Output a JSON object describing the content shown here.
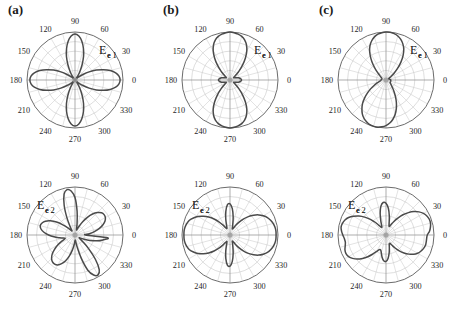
{
  "figure": {
    "panels": [
      {
        "id": "panel-a-top",
        "panel_label": "(a)",
        "field_label": "E",
        "field_sub_bold": "e",
        "field_sub_num": "1",
        "label_pos": "right",
        "x": 0,
        "y": 0
      },
      {
        "id": "panel-b-top",
        "panel_label": "(b)",
        "field_label": "E",
        "field_sub_bold": "e",
        "field_sub_num": "1",
        "label_pos": "right",
        "x": 155,
        "y": 0
      },
      {
        "id": "panel-c-top",
        "panel_label": "(c)",
        "field_label": "E",
        "field_sub_bold": "e",
        "field_sub_num": "1",
        "label_pos": "right",
        "x": 311,
        "y": 0
      },
      {
        "id": "panel-a-bottom",
        "panel_label": "",
        "field_label": "E",
        "field_sub_bold": "e",
        "field_sub_num": "2",
        "label_pos": "left",
        "x": 0,
        "y": 155
      },
      {
        "id": "panel-b-bottom",
        "panel_label": "",
        "field_label": "E",
        "field_sub_bold": "e",
        "field_sub_num": "2",
        "label_pos": "left",
        "x": 155,
        "y": 155
      },
      {
        "id": "panel-c-bottom",
        "panel_label": "",
        "field_label": "E",
        "field_sub_bold": "e",
        "field_sub_num": "2",
        "label_pos": "left",
        "x": 311,
        "y": 155
      }
    ]
  },
  "chart_data": [
    {
      "id": "panel-a-top",
      "type": "line",
      "subtype": "polar",
      "title": "(a) Ee1",
      "xlabel": "angle (degrees)",
      "ylabel": "normalized field magnitude",
      "theta_ticks": [
        0,
        30,
        60,
        90,
        120,
        150,
        180,
        210,
        240,
        270,
        300,
        330
      ],
      "theta_tick_labels": [
        "0",
        "30",
        "60",
        "90",
        "120",
        "150",
        "180",
        "210",
        "240",
        "270",
        "300",
        "330"
      ],
      "grid": true,
      "grid_rings": 5,
      "rlim": [
        0,
        1
      ],
      "legend": "none",
      "description": "four-lobe clover pattern, maxima at 0, 90, 180, 270 degrees",
      "theta": [
        0,
        5,
        10,
        15,
        20,
        25,
        30,
        35,
        40,
        45,
        50,
        55,
        60,
        65,
        70,
        75,
        80,
        85,
        90,
        95,
        100,
        105,
        110,
        115,
        120,
        125,
        130,
        135,
        140,
        145,
        150,
        155,
        160,
        165,
        170,
        175,
        180,
        185,
        190,
        195,
        200,
        205,
        210,
        215,
        220,
        225,
        230,
        235,
        240,
        245,
        250,
        255,
        260,
        265,
        270,
        275,
        280,
        285,
        290,
        295,
        300,
        305,
        310,
        315,
        320,
        325,
        330,
        335,
        340,
        345,
        350,
        355
      ],
      "r": [
        0.94,
        0.92,
        0.86,
        0.76,
        0.63,
        0.49,
        0.34,
        0.2,
        0.09,
        0.03,
        0.03,
        0.09,
        0.2,
        0.35,
        0.52,
        0.68,
        0.82,
        0.92,
        0.96,
        0.92,
        0.82,
        0.68,
        0.52,
        0.35,
        0.2,
        0.09,
        0.03,
        0.03,
        0.09,
        0.2,
        0.34,
        0.49,
        0.63,
        0.76,
        0.86,
        0.92,
        0.94,
        0.92,
        0.86,
        0.76,
        0.63,
        0.49,
        0.34,
        0.2,
        0.09,
        0.03,
        0.03,
        0.09,
        0.2,
        0.35,
        0.52,
        0.68,
        0.82,
        0.92,
        0.96,
        0.92,
        0.82,
        0.68,
        0.52,
        0.35,
        0.2,
        0.09,
        0.03,
        0.03,
        0.09,
        0.2,
        0.34,
        0.49,
        0.63,
        0.76,
        0.86,
        0.92
      ]
    },
    {
      "id": "panel-b-top",
      "type": "line",
      "subtype": "polar",
      "title": "(b) Ee1",
      "xlabel": "angle (degrees)",
      "ylabel": "normalized field magnitude",
      "theta_ticks": [
        0,
        30,
        60,
        90,
        120,
        150,
        180,
        210,
        240,
        270,
        300,
        330
      ],
      "theta_tick_labels": [
        "0",
        "30",
        "60",
        "90",
        "120",
        "150",
        "180",
        "210",
        "240",
        "270",
        "300",
        "330"
      ],
      "grid": true,
      "grid_rings": 5,
      "rlim": [
        0,
        1
      ],
      "legend": "none",
      "description": "two large vertical lobes at 90 and 270 degrees with small side lobes near 0 and 180 degrees",
      "theta": [
        0,
        5,
        10,
        15,
        20,
        25,
        30,
        35,
        40,
        45,
        50,
        55,
        60,
        65,
        70,
        75,
        80,
        85,
        90,
        95,
        100,
        105,
        110,
        115,
        120,
        125,
        130,
        135,
        140,
        145,
        150,
        155,
        160,
        165,
        170,
        175,
        180,
        185,
        190,
        195,
        200,
        205,
        210,
        215,
        220,
        225,
        230,
        235,
        240,
        245,
        250,
        255,
        260,
        265,
        270,
        275,
        280,
        285,
        290,
        295,
        300,
        305,
        310,
        315,
        320,
        325,
        330,
        335,
        340,
        345,
        350,
        355
      ],
      "r": [
        0.24,
        0.23,
        0.21,
        0.18,
        0.14,
        0.11,
        0.09,
        0.1,
        0.16,
        0.27,
        0.41,
        0.56,
        0.7,
        0.81,
        0.89,
        0.94,
        0.97,
        0.99,
        1.0,
        0.99,
        0.97,
        0.94,
        0.89,
        0.81,
        0.7,
        0.56,
        0.41,
        0.27,
        0.16,
        0.1,
        0.09,
        0.11,
        0.14,
        0.18,
        0.21,
        0.23,
        0.24,
        0.23,
        0.21,
        0.18,
        0.14,
        0.11,
        0.09,
        0.1,
        0.16,
        0.27,
        0.41,
        0.56,
        0.7,
        0.81,
        0.89,
        0.94,
        0.97,
        0.99,
        1.0,
        0.99,
        0.97,
        0.94,
        0.89,
        0.81,
        0.7,
        0.56,
        0.41,
        0.27,
        0.16,
        0.1,
        0.09,
        0.11,
        0.14,
        0.18,
        0.21,
        0.23
      ]
    },
    {
      "id": "panel-c-top",
      "type": "line",
      "subtype": "polar",
      "title": "(c) Ee1",
      "xlabel": "angle (degrees)",
      "ylabel": "normalized field magnitude",
      "theta_ticks": [
        0,
        30,
        60,
        90,
        120,
        150,
        180,
        210,
        240,
        270,
        300,
        330
      ],
      "theta_tick_labels": [
        "0",
        "30",
        "60",
        "90",
        "120",
        "150",
        "180",
        "210",
        "240",
        "270",
        "300",
        "330"
      ],
      "grid": true,
      "grid_rings": 5,
      "rlim": [
        0,
        1
      ],
      "legend": "none",
      "description": "two large tilted lobes, upper lobe peaking near 100 degrees and lower lobe near 285 degrees, slight asymmetry",
      "theta": [
        0,
        5,
        10,
        15,
        20,
        25,
        30,
        35,
        40,
        45,
        50,
        55,
        60,
        65,
        70,
        75,
        80,
        85,
        90,
        95,
        100,
        105,
        110,
        115,
        120,
        125,
        130,
        135,
        140,
        145,
        150,
        155,
        160,
        165,
        170,
        175,
        180,
        185,
        190,
        195,
        200,
        205,
        210,
        215,
        220,
        225,
        230,
        235,
        240,
        245,
        250,
        255,
        260,
        265,
        270,
        275,
        280,
        285,
        290,
        295,
        300,
        305,
        310,
        315,
        320,
        325,
        330,
        335,
        340,
        345,
        350,
        355
      ],
      "r": [
        0.1,
        0.09,
        0.08,
        0.07,
        0.06,
        0.06,
        0.08,
        0.13,
        0.22,
        0.34,
        0.48,
        0.62,
        0.74,
        0.83,
        0.9,
        0.95,
        0.98,
        1.0,
        1.0,
        0.99,
        0.97,
        0.93,
        0.87,
        0.79,
        0.68,
        0.55,
        0.42,
        0.3,
        0.21,
        0.15,
        0.12,
        0.1,
        0.09,
        0.09,
        0.09,
        0.1,
        0.1,
        0.11,
        0.13,
        0.16,
        0.21,
        0.28,
        0.37,
        0.47,
        0.58,
        0.69,
        0.78,
        0.86,
        0.92,
        0.96,
        0.99,
        1.0,
        1.0,
        0.98,
        0.95,
        0.9,
        0.83,
        0.74,
        0.63,
        0.51,
        0.39,
        0.29,
        0.21,
        0.16,
        0.13,
        0.11,
        0.1,
        0.1,
        0.1,
        0.1,
        0.1,
        0.1
      ]
    },
    {
      "id": "panel-a-bottom",
      "type": "line",
      "subtype": "polar",
      "title": "(a) Ee2",
      "xlabel": "angle (degrees)",
      "ylabel": "normalized field magnitude",
      "theta_ticks": [
        0,
        30,
        60,
        90,
        120,
        150,
        180,
        210,
        240,
        270,
        300,
        330
      ],
      "theta_tick_labels": [
        "0",
        "30",
        "60",
        "90",
        "120",
        "150",
        "180",
        "210",
        "240",
        "270",
        "300",
        "330"
      ],
      "grid": true,
      "grid_rings": 5,
      "rlim": [
        0,
        1
      ],
      "legend": "none",
      "description": "six-lobe pattern: narrow vertical lobes at 90 and 270 degrees plus four diagonal lobes near 35, 145, 215 and 325 degrees",
      "theta": [
        0,
        5,
        10,
        15,
        20,
        25,
        30,
        35,
        40,
        45,
        50,
        55,
        60,
        65,
        70,
        75,
        80,
        85,
        90,
        95,
        100,
        105,
        110,
        115,
        120,
        125,
        130,
        135,
        140,
        145,
        150,
        155,
        160,
        165,
        170,
        175,
        180,
        185,
        190,
        195,
        200,
        205,
        210,
        215,
        220,
        225,
        230,
        235,
        240,
        245,
        250,
        255,
        260,
        265,
        270,
        275,
        280,
        285,
        290,
        295,
        300,
        305,
        310,
        315,
        320,
        325,
        330,
        335,
        340,
        345,
        350,
        355
      ],
      "r": [
        0.22,
        0.3,
        0.41,
        0.52,
        0.62,
        0.69,
        0.73,
        0.74,
        0.72,
        0.66,
        0.57,
        0.45,
        0.32,
        0.2,
        0.12,
        0.12,
        0.25,
        0.5,
        0.78,
        0.92,
        0.96,
        0.88,
        0.66,
        0.4,
        0.2,
        0.11,
        0.12,
        0.21,
        0.33,
        0.47,
        0.59,
        0.68,
        0.73,
        0.75,
        0.72,
        0.65,
        0.55,
        0.44,
        0.33,
        0.25,
        0.22,
        0.3,
        0.41,
        0.52,
        0.62,
        0.69,
        0.73,
        0.74,
        0.72,
        0.66,
        0.57,
        0.45,
        0.32,
        0.2,
        0.12,
        0.12,
        0.25,
        0.5,
        0.78,
        0.92,
        0.96,
        0.88,
        0.66,
        0.4,
        0.2,
        0.11,
        0.12,
        0.21,
        0.33,
        0.47,
        0.59,
        0.68
      ]
    },
    {
      "id": "panel-b-bottom",
      "type": "line",
      "subtype": "polar",
      "title": "(b) Ee2",
      "xlabel": "angle (degrees)",
      "ylabel": "normalized field magnitude",
      "theta_ticks": [
        0,
        30,
        60,
        90,
        120,
        150,
        180,
        210,
        240,
        270,
        300,
        330
      ],
      "theta_tick_labels": [
        "0",
        "30",
        "60",
        "90",
        "120",
        "150",
        "180",
        "210",
        "240",
        "270",
        "300",
        "330"
      ],
      "grid": true,
      "grid_rings": 5,
      "rlim": [
        0,
        1
      ],
      "legend": "none",
      "description": "large horizontal lobes at 0 and 180 degrees plus narrower vertical lobes at 90 and 270 degrees",
      "theta": [
        0,
        5,
        10,
        15,
        20,
        25,
        30,
        35,
        40,
        45,
        50,
        55,
        60,
        65,
        70,
        75,
        80,
        85,
        90,
        95,
        100,
        105,
        110,
        115,
        120,
        125,
        130,
        135,
        140,
        145,
        150,
        155,
        160,
        165,
        170,
        175,
        180,
        185,
        190,
        195,
        200,
        205,
        210,
        215,
        220,
        225,
        230,
        235,
        240,
        245,
        250,
        255,
        260,
        265,
        270,
        275,
        280,
        285,
        290,
        295,
        300,
        305,
        310,
        315,
        320,
        325,
        330,
        335,
        340,
        345,
        350,
        355
      ],
      "r": [
        0.96,
        0.96,
        0.95,
        0.93,
        0.9,
        0.86,
        0.8,
        0.73,
        0.64,
        0.54,
        0.43,
        0.32,
        0.22,
        0.15,
        0.14,
        0.22,
        0.38,
        0.55,
        0.65,
        0.63,
        0.5,
        0.34,
        0.21,
        0.15,
        0.17,
        0.25,
        0.36,
        0.47,
        0.58,
        0.68,
        0.77,
        0.84,
        0.9,
        0.93,
        0.95,
        0.96,
        0.96,
        0.96,
        0.95,
        0.93,
        0.9,
        0.84,
        0.77,
        0.68,
        0.58,
        0.47,
        0.36,
        0.25,
        0.17,
        0.15,
        0.21,
        0.34,
        0.5,
        0.63,
        0.65,
        0.55,
        0.38,
        0.22,
        0.14,
        0.15,
        0.22,
        0.32,
        0.43,
        0.54,
        0.64,
        0.73,
        0.8,
        0.86,
        0.9,
        0.93,
        0.95,
        0.96
      ]
    },
    {
      "id": "panel-c-bottom",
      "type": "line",
      "subtype": "polar",
      "title": "(c) Ee2",
      "xlabel": "angle (degrees)",
      "ylabel": "normalized field magnitude",
      "theta_ticks": [
        0,
        30,
        60,
        90,
        120,
        150,
        180,
        210,
        240,
        270,
        300,
        330
      ],
      "theta_tick_labels": [
        "0",
        "30",
        "60",
        "90",
        "120",
        "150",
        "180",
        "210",
        "240",
        "270",
        "300",
        "330"
      ],
      "grid": true,
      "grid_rings": 5,
      "rlim": [
        0,
        1
      ],
      "legend": "none",
      "description": "asymmetric four-lobe pattern, broad lobes tilted toward 20 and 200 degrees with narrower vertical lobes near 95 and 265 degrees",
      "theta": [
        0,
        5,
        10,
        15,
        20,
        25,
        30,
        35,
        40,
        45,
        50,
        55,
        60,
        65,
        70,
        75,
        80,
        85,
        90,
        95,
        100,
        105,
        110,
        115,
        120,
        125,
        130,
        135,
        140,
        145,
        150,
        155,
        160,
        165,
        170,
        175,
        180,
        185,
        190,
        195,
        200,
        205,
        210,
        215,
        220,
        225,
        230,
        235,
        240,
        245,
        250,
        255,
        260,
        265,
        270,
        275,
        280,
        285,
        290,
        295,
        300,
        305,
        310,
        315,
        320,
        325,
        330,
        335,
        340,
        345,
        350,
        355
      ],
      "r": [
        0.86,
        0.91,
        0.94,
        0.96,
        0.96,
        0.94,
        0.9,
        0.84,
        0.76,
        0.66,
        0.55,
        0.43,
        0.32,
        0.23,
        0.19,
        0.25,
        0.4,
        0.56,
        0.66,
        0.68,
        0.61,
        0.47,
        0.32,
        0.21,
        0.18,
        0.23,
        0.34,
        0.46,
        0.58,
        0.69,
        0.78,
        0.86,
        0.91,
        0.94,
        0.95,
        0.93,
        0.9,
        0.87,
        0.86,
        0.88,
        0.91,
        0.92,
        0.9,
        0.85,
        0.78,
        0.69,
        0.59,
        0.49,
        0.4,
        0.34,
        0.33,
        0.38,
        0.47,
        0.54,
        0.55,
        0.49,
        0.38,
        0.27,
        0.2,
        0.19,
        0.24,
        0.33,
        0.43,
        0.53,
        0.62,
        0.7,
        0.76,
        0.8,
        0.83,
        0.85,
        0.85,
        0.85
      ]
    }
  ]
}
